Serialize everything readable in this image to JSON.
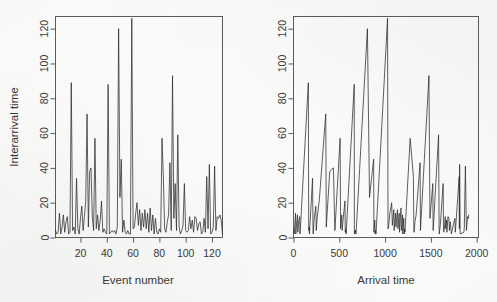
{
  "figure": {
    "background_color": "#fdfdfc",
    "line_color": "#2b2b2b",
    "axis_color": "#5d5d5d",
    "panels": [
      "left",
      "right"
    ]
  },
  "left_panel": {
    "name": "interarrival-time-vs-event-number",
    "xlabel": "Event number",
    "ylabel": "Interarrival time",
    "x_ticks": [
      0,
      20,
      40,
      60,
      80,
      100,
      120
    ],
    "y_ticks": [
      0,
      20,
      40,
      60,
      80,
      100,
      120
    ]
  },
  "right_panel": {
    "name": "interarrival-time-vs-arrival-time",
    "xlabel": "Arrival time",
    "ylabel": "",
    "x_ticks": [
      0,
      500,
      1000,
      1500,
      2000
    ],
    "y_ticks": [
      0,
      20,
      40,
      60,
      80,
      100,
      120
    ]
  },
  "chart_data": [
    {
      "type": "line",
      "panel": "left",
      "title": "",
      "xlabel": "Event number",
      "ylabel": "Interarrival time",
      "xlim": [
        1,
        128
      ],
      "ylim": [
        0,
        127
      ],
      "xticks": [
        0,
        20,
        40,
        60,
        80,
        100,
        120
      ],
      "yticks": [
        0,
        20,
        40,
        60,
        80,
        100,
        120
      ],
      "grid": false,
      "legend": "none",
      "x": [
        1,
        2,
        3,
        4,
        5,
        6,
        7,
        8,
        9,
        10,
        11,
        12,
        13,
        14,
        15,
        16,
        17,
        18,
        19,
        20,
        21,
        22,
        23,
        24,
        25,
        26,
        27,
        28,
        29,
        30,
        31,
        32,
        33,
        34,
        35,
        36,
        37,
        38,
        39,
        40,
        41,
        42,
        43,
        44,
        45,
        46,
        47,
        48,
        49,
        50,
        51,
        52,
        53,
        54,
        55,
        56,
        57,
        58,
        59,
        60,
        61,
        62,
        63,
        64,
        65,
        66,
        67,
        68,
        69,
        70,
        71,
        72,
        73,
        74,
        75,
        76,
        77,
        78,
        79,
        80,
        81,
        82,
        83,
        84,
        85,
        86,
        87,
        88,
        89,
        90,
        91,
        92,
        93,
        94,
        95,
        96,
        97,
        98,
        99,
        100,
        101,
        102,
        103,
        104,
        105,
        106,
        107,
        108,
        109,
        110,
        111,
        112,
        113,
        114,
        115,
        116,
        117,
        118,
        119,
        120,
        121,
        122,
        123,
        124,
        125,
        126,
        127,
        128
      ],
      "y": [
        4,
        2,
        3,
        14,
        2,
        6,
        13,
        3,
        9,
        12,
        2,
        3,
        89,
        4,
        6,
        2,
        34,
        5,
        2,
        11,
        18,
        4,
        12,
        21,
        71,
        6,
        38,
        40,
        12,
        4,
        57,
        5,
        13,
        4,
        10,
        21,
        3,
        5,
        3,
        2,
        88,
        2,
        3,
        4,
        3,
        4,
        2,
        6,
        120,
        23,
        45,
        3,
        10,
        3,
        2,
        4,
        2,
        2,
        126,
        5,
        6,
        14,
        20,
        7,
        16,
        4,
        14,
        6,
        16,
        5,
        14,
        3,
        17,
        4,
        13,
        2,
        11,
        3,
        2,
        5,
        3,
        57,
        35,
        5,
        3,
        9,
        13,
        43,
        4,
        93,
        11,
        31,
        4,
        59,
        6,
        2,
        4,
        7,
        31,
        4,
        3,
        4,
        12,
        5,
        10,
        3,
        12,
        11,
        4,
        8,
        9,
        2,
        3,
        11,
        3,
        35,
        5,
        42,
        2,
        3,
        6,
        41,
        4,
        12,
        11,
        13,
        10,
        2
      ]
    },
    {
      "type": "line",
      "panel": "right",
      "title": "",
      "xlabel": "Arrival time",
      "ylabel": "",
      "xlim": [
        0,
        2020
      ],
      "ylim": [
        0,
        127
      ],
      "xticks": [
        0,
        500,
        1000,
        1500,
        2000
      ],
      "yticks": [
        0,
        20,
        40,
        60,
        80,
        100,
        120
      ],
      "grid": false,
      "legend": "none",
      "x": [
        4,
        6,
        9,
        23,
        25,
        31,
        44,
        47,
        56,
        68,
        70,
        73,
        162,
        166,
        172,
        174,
        208,
        213,
        215,
        226,
        244,
        248,
        260,
        281,
        352,
        358,
        396,
        436,
        448,
        452,
        509,
        514,
        527,
        531,
        541,
        562,
        565,
        570,
        573,
        575,
        663,
        665,
        668,
        672,
        675,
        679,
        681,
        687,
        807,
        830,
        875,
        878,
        888,
        891,
        893,
        897,
        899,
        901,
        1027,
        1032,
        1038,
        1052,
        1072,
        1079,
        1095,
        1099,
        1113,
        1119,
        1135,
        1140,
        1154,
        1157,
        1174,
        1178,
        1191,
        1193,
        1204,
        1207,
        1209,
        1214,
        1217,
        1274,
        1309,
        1314,
        1317,
        1326,
        1339,
        1382,
        1386,
        1479,
        1490,
        1521,
        1525,
        1584,
        1590,
        1592,
        1596,
        1603,
        1634,
        1638,
        1641,
        1645,
        1657,
        1662,
        1672,
        1675,
        1687,
        1698,
        1702,
        1710,
        1713,
        1724,
        1727,
        1762,
        1767,
        1809,
        1811,
        1814,
        1820,
        1861,
        1865,
        1877,
        1888,
        1901,
        1911,
        1913
      ],
      "y": [
        4,
        2,
        3,
        14,
        2,
        6,
        13,
        3,
        9,
        12,
        2,
        3,
        89,
        4,
        6,
        2,
        34,
        5,
        2,
        11,
        18,
        4,
        12,
        21,
        71,
        6,
        38,
        40,
        12,
        4,
        57,
        5,
        13,
        4,
        10,
        21,
        3,
        5,
        3,
        2,
        88,
        2,
        3,
        4,
        3,
        4,
        2,
        6,
        120,
        23,
        45,
        3,
        10,
        3,
        2,
        4,
        2,
        2,
        126,
        5,
        6,
        14,
        20,
        7,
        16,
        4,
        14,
        6,
        16,
        5,
        14,
        3,
        17,
        4,
        13,
        2,
        11,
        3,
        2,
        5,
        3,
        57,
        35,
        5,
        3,
        9,
        13,
        43,
        4,
        93,
        11,
        31,
        4,
        59,
        6,
        2,
        4,
        7,
        31,
        4,
        3,
        4,
        12,
        5,
        10,
        3,
        12,
        11,
        4,
        8,
        9,
        2,
        3,
        11,
        3,
        35,
        5,
        42,
        2,
        3,
        6,
        41,
        4,
        12,
        11,
        13,
        10,
        2
      ]
    }
  ]
}
